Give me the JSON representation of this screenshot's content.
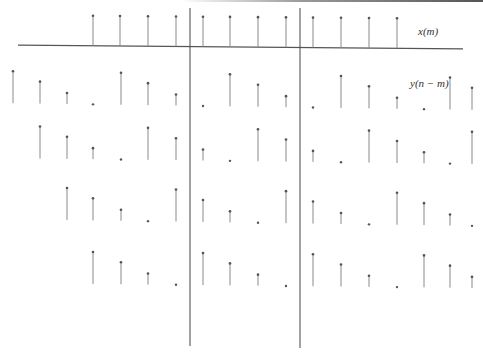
{
  "diagram": {
    "labels": {
      "x_label": "x(m)",
      "y_label": "y(n − m)"
    },
    "colors": {
      "stem": "#8a8a8a",
      "marker": "#555555",
      "axis": "#555555",
      "divider": "#444444"
    },
    "x_sequence": {
      "baseline_y": [
        45,
        49
      ],
      "top_offset": 30,
      "positions": [
        93,
        120,
        148,
        176,
        203,
        230,
        258,
        286,
        313,
        341,
        369,
        397
      ],
      "axis_x": [
        18,
        463
      ]
    },
    "dividers": [
      {
        "x": 190,
        "y_top": 8,
        "y_bottom": 346
      },
      {
        "x": 300,
        "y_top": 8,
        "y_bottom": 348
      }
    ],
    "y_rows": [
      {
        "start_index": 0,
        "baseline_y": [
          103,
          110
        ]
      },
      {
        "start_index": 1,
        "baseline_y": [
          158,
          164
        ]
      },
      {
        "start_index": 2,
        "baseline_y": [
          219,
          226
        ]
      },
      {
        "start_index": 3,
        "baseline_y": [
          283,
          288
        ]
      }
    ],
    "y_positions": [
      13,
      40,
      67,
      93,
      121,
      148,
      176,
      203,
      230,
      258,
      286,
      313,
      341,
      369,
      397,
      424,
      450,
      472
    ],
    "y_pattern_heights": [
      32,
      22,
      11,
      0
    ]
  }
}
